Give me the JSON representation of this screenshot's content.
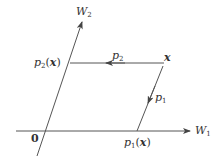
{
  "diagram": {
    "axes": {
      "w1": {
        "symbol": "W",
        "subscript": "1",
        "color": "#555555"
      },
      "w2": {
        "symbol": "W",
        "subscript": "2",
        "color": "#555555"
      }
    },
    "origin": {
      "label": "0"
    },
    "point": {
      "label": "x"
    },
    "projections": {
      "p1": {
        "symbol": "p",
        "subscript": "1",
        "result_open": "(",
        "result_arg": "x",
        "result_close": ")"
      },
      "p2": {
        "symbol": "p",
        "subscript": "2",
        "result_open": "(",
        "result_arg": "x",
        "result_close": ")"
      }
    },
    "colors": {
      "line": "#555555",
      "text": "#333333",
      "background": "#ffffff"
    }
  }
}
